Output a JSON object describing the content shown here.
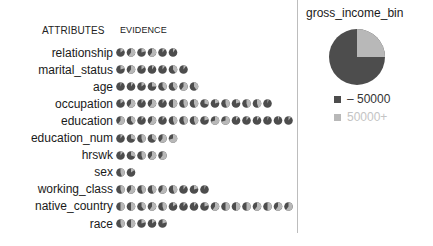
{
  "headers": {
    "attributes": "ATTRIBUTES",
    "evidence": "EVIDENCE"
  },
  "target": {
    "title": "gross_income_bin",
    "legend": [
      {
        "label": "– 50000",
        "color": "#4d4d4d"
      },
      {
        "label": "50000+",
        "color": "#b8b8b8"
      }
    ]
  },
  "colors": {
    "low": "#4d4d4d",
    "high": "#b8b8b8"
  },
  "chart_data": {
    "type": "pie",
    "title": "gross_income_bin",
    "categories": [
      "– 50000",
      "50000+"
    ],
    "overall": {
      "– 50000": 0.75,
      "50000+": 0.25
    },
    "attributes": [
      {
        "name": "relationship",
        "high_share": [
          0.15,
          0.6,
          0.2,
          0.6,
          0.1,
          0.1
        ]
      },
      {
        "name": "marital_status",
        "high_share": [
          0.2,
          0.6,
          0.15,
          0.1,
          0.1,
          0.4,
          0.1
        ]
      },
      {
        "name": "age",
        "high_share": [
          0.05,
          0.1,
          0.15,
          0.25,
          0.4,
          0.4,
          0.6,
          0.4
        ]
      },
      {
        "name": "occupation",
        "high_share": [
          0.15,
          0.6,
          0.1,
          0.6,
          0.1,
          0.5,
          0.45,
          0.45,
          0.3,
          0.2,
          0.45,
          0.2,
          0.45,
          0.45,
          0.05
        ]
      },
      {
        "name": "education",
        "high_share": [
          0.6,
          0.4,
          0.1,
          0.6,
          0.1,
          0.45,
          0.45,
          0.45,
          0.2,
          0.7,
          0.7,
          0.1,
          0.1,
          0.1,
          0.05,
          0.05,
          0.1
        ]
      },
      {
        "name": "education_num",
        "high_share": [
          0.1,
          0.3,
          0.45,
          0.35,
          0.6,
          0.7
        ]
      },
      {
        "name": "hrswk",
        "high_share": [
          0.1,
          0.3,
          0.45,
          0.6,
          0.6
        ]
      },
      {
        "name": "sex",
        "high_share": [
          0.45,
          0.15
        ]
      },
      {
        "name": "working_class",
        "high_share": [
          0.45,
          0.6,
          0.45,
          0.45,
          0.6,
          0.45,
          0.1,
          0.2,
          0.05
        ]
      },
      {
        "name": "native_country",
        "high_share": [
          0.5,
          0.5,
          0.4,
          0.6,
          0.45,
          0.15,
          0.1,
          0.1,
          0.2,
          0.6,
          0.5,
          0.5,
          0.5,
          0.6,
          0.5,
          0.6,
          0.6
        ]
      },
      {
        "name": "race",
        "high_share": [
          0.45,
          0.5,
          0.2,
          0.15,
          0.2
        ]
      }
    ]
  }
}
